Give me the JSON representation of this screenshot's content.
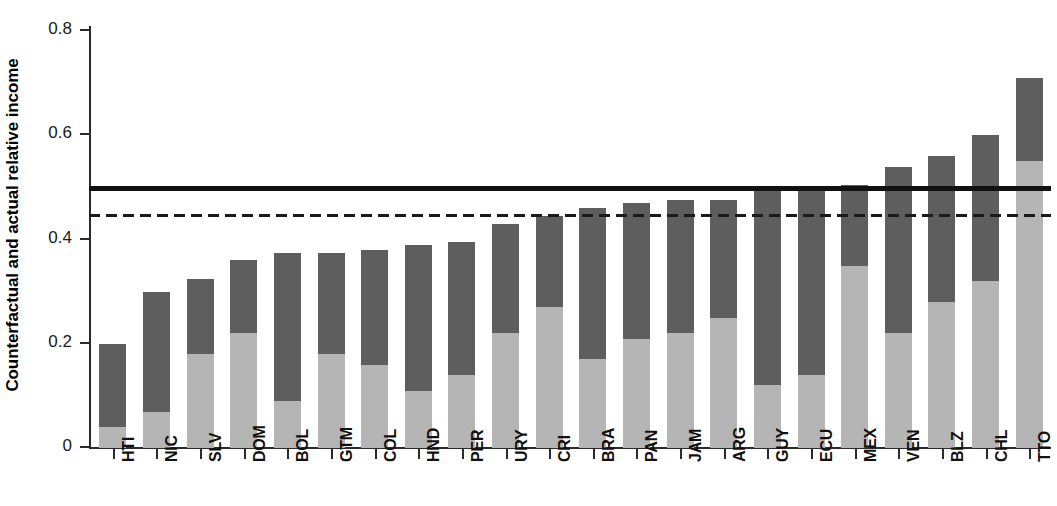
{
  "chart_data": {
    "type": "bar",
    "title": "",
    "subtitle": "",
    "xlabel": "",
    "ylabel": "Counterfactual and actual relative income",
    "ylim": [
      0,
      0.85
    ],
    "ytick_labels": [
      "0",
      "0.2",
      "0.4",
      "0.6",
      "0.8"
    ],
    "ytick_values": [
      0,
      0.2,
      0.4,
      0.6,
      0.8
    ],
    "grid": false,
    "legend": null,
    "stacked": true,
    "categories": [
      "HTI",
      "NIC",
      "SLV",
      "DOM",
      "BOL",
      "GTM",
      "COL",
      "HND",
      "PER",
      "URY",
      "CRI",
      "BRA",
      "PAN",
      "JAM",
      "ARG",
      "GUY",
      "ECU",
      "MEX",
      "VEN",
      "BLZ",
      "CHL",
      "TTO"
    ],
    "series": [
      {
        "name": "actual relative income",
        "color": "#b5b5b5",
        "values": [
          0.04,
          0.07,
          0.18,
          0.22,
          0.09,
          0.18,
          0.16,
          0.11,
          0.14,
          0.22,
          0.27,
          0.17,
          0.21,
          0.22,
          0.25,
          0.12,
          0.14,
          0.35,
          0.22,
          0.28,
          0.32,
          0.55
        ]
      },
      {
        "name": "counterfactual relative income",
        "color": "#5e5e5e",
        "values": [
          0.2,
          0.3,
          0.325,
          0.36,
          0.375,
          0.375,
          0.38,
          0.39,
          0.395,
          0.43,
          0.445,
          0.46,
          0.47,
          0.475,
          0.475,
          0.495,
          0.5,
          0.505,
          0.54,
          0.56,
          0.6,
          0.71
        ]
      }
    ],
    "reference_lines": [
      {
        "name": "counterfactual-mean-line",
        "value": 0.497,
        "style": "solid",
        "color": "#111111"
      },
      {
        "name": "actual-mean-line",
        "value": 0.445,
        "style": "dashed",
        "color": "#1a1a1a"
      }
    ]
  }
}
